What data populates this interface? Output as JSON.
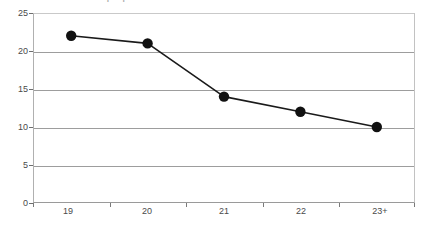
{
  "chart_data": {
    "type": "line",
    "title": "",
    "subtitle": "",
    "xlabel": "",
    "ylabel": "",
    "categories": [
      "19",
      "20",
      "21",
      "22",
      "23+"
    ],
    "values": [
      22,
      21,
      14,
      12,
      10
    ],
    "series": [
      {
        "name": "",
        "values": [
          22,
          21,
          14,
          12,
          10
        ]
      }
    ],
    "ylim": [
      0,
      25
    ],
    "yticks": [
      0,
      5,
      10,
      15,
      20,
      25
    ],
    "ytick_labels": [
      "0",
      "5",
      "10",
      "15",
      "20",
      "25"
    ],
    "xtick_labels": [
      "19",
      "20",
      "21",
      "22",
      "23+"
    ],
    "grid": "horizontal",
    "legend": "none",
    "marker": "filled-circle",
    "line_color": "#1a1a1a",
    "marker_color": "#111111",
    "grid_color": "#9d9d9d",
    "axis_color": "#9a9a9a",
    "background": "#ffffff"
  },
  "chart": {
    "title_fragment": "Number of people"
  }
}
